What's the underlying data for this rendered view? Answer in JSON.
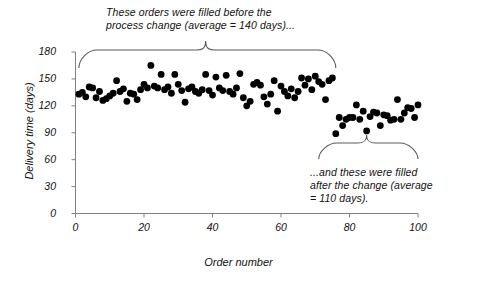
{
  "chart_data": {
    "type": "scatter",
    "title": "",
    "xlabel": "Order number",
    "ylabel": "Delivery time (days)",
    "xlim": [
      0,
      100
    ],
    "ylim": [
      0,
      180
    ],
    "xticks": [
      0,
      20,
      40,
      60,
      80,
      100
    ],
    "yticks": [
      0,
      30,
      60,
      90,
      120,
      150,
      180
    ],
    "grid": false,
    "legend": null,
    "marker": {
      "shape": "circle",
      "color": "#000000",
      "size": 3.4
    },
    "series": [
      {
        "name": "Before process change",
        "average": 140,
        "points": [
          [
            1,
            133
          ],
          [
            2,
            135
          ],
          [
            3,
            130
          ],
          [
            4,
            141
          ],
          [
            5,
            140
          ],
          [
            6,
            129
          ],
          [
            7,
            136
          ],
          [
            8,
            126
          ],
          [
            9,
            128
          ],
          [
            10,
            131
          ],
          [
            11,
            134
          ],
          [
            12,
            148
          ],
          [
            13,
            136
          ],
          [
            14,
            139
          ],
          [
            15,
            125
          ],
          [
            16,
            134
          ],
          [
            17,
            133
          ],
          [
            18,
            127
          ],
          [
            19,
            138
          ],
          [
            20,
            144
          ],
          [
            21,
            140
          ],
          [
            22,
            165
          ],
          [
            23,
            142
          ],
          [
            24,
            140
          ],
          [
            25,
            155
          ],
          [
            26,
            138
          ],
          [
            27,
            141
          ],
          [
            28,
            134
          ],
          [
            29,
            155
          ],
          [
            30,
            144
          ],
          [
            31,
            137
          ],
          [
            32,
            124
          ],
          [
            33,
            139
          ],
          [
            34,
            141
          ],
          [
            35,
            136
          ],
          [
            36,
            134
          ],
          [
            37,
            138
          ],
          [
            38,
            155
          ],
          [
            39,
            137
          ],
          [
            40,
            132
          ],
          [
            41,
            152
          ],
          [
            42,
            140
          ],
          [
            43,
            137
          ],
          [
            44,
            154
          ],
          [
            45,
            136
          ],
          [
            46,
            133
          ],
          [
            47,
            140
          ],
          [
            48,
            156
          ],
          [
            49,
            129
          ],
          [
            50,
            120
          ],
          [
            51,
            125
          ],
          [
            52,
            144
          ],
          [
            53,
            146
          ],
          [
            54,
            143
          ],
          [
            55,
            130
          ],
          [
            56,
            122
          ],
          [
            57,
            133
          ],
          [
            58,
            148
          ],
          [
            59,
            114
          ],
          [
            60,
            142
          ],
          [
            61,
            136
          ],
          [
            62,
            131
          ],
          [
            63,
            139
          ],
          [
            64,
            129
          ],
          [
            65,
            136
          ],
          [
            66,
            151
          ],
          [
            67,
            143
          ],
          [
            68,
            150
          ],
          [
            69,
            138
          ],
          [
            70,
            153
          ],
          [
            71,
            147
          ],
          [
            72,
            144
          ],
          [
            73,
            127
          ],
          [
            74,
            148
          ],
          [
            75,
            151
          ]
        ]
      },
      {
        "name": "After process change",
        "average": 110,
        "points": [
          [
            76,
            89
          ],
          [
            77,
            107
          ],
          [
            78,
            98
          ],
          [
            79,
            105
          ],
          [
            80,
            107
          ],
          [
            81,
            107
          ],
          [
            82,
            121
          ],
          [
            83,
            105
          ],
          [
            84,
            114
          ],
          [
            85,
            92
          ],
          [
            86,
            108
          ],
          [
            87,
            113
          ],
          [
            88,
            112
          ],
          [
            89,
            98
          ],
          [
            90,
            110
          ],
          [
            91,
            109
          ],
          [
            92,
            104
          ],
          [
            93,
            105
          ],
          [
            94,
            127
          ],
          [
            95,
            105
          ],
          [
            96,
            112
          ],
          [
            97,
            118
          ],
          [
            98,
            117
          ],
          [
            99,
            107
          ],
          [
            100,
            121
          ]
        ]
      }
    ],
    "annotations": [
      {
        "id": "before",
        "text": "These orders were filled before the\nprocess change (average = 140 days)...",
        "brace": {
          "x_start": 1,
          "x_end": 76,
          "peak_x": 38
        }
      },
      {
        "id": "after",
        "text": "...and these were filled\nafter the change (average\n= 110 days).",
        "brace": {
          "x_start": 71,
          "x_end": 100,
          "peak_x": 85
        }
      }
    ]
  }
}
